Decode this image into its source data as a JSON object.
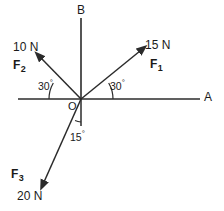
{
  "diagram": {
    "type": "free-body-vector-diagram",
    "origin_label": "O",
    "stroke_color": "#2b2b2b",
    "text_color": "#1a1a1a",
    "background": "#ffffff",
    "axes": [
      {
        "name": "horizontal-axis",
        "label": "A",
        "direction": "right",
        "has_arrowhead": false
      },
      {
        "name": "vertical-axis",
        "label": "B",
        "direction": "up",
        "has_arrowhead": false
      }
    ],
    "vectors": [
      {
        "name": "F1",
        "label": "F",
        "subscript": "1",
        "magnitude": "15 N",
        "magnitude_value": 15,
        "unit": "N",
        "angle_from_positive_x_deg": 30,
        "angle_label": "30",
        "angle_reference": "positive x-axis (OA)",
        "quadrant": "upper-right"
      },
      {
        "name": "F2",
        "label": "F",
        "subscript": "2",
        "magnitude": "10 N",
        "magnitude_value": 10,
        "unit": "N",
        "angle_from_positive_x_deg": 150,
        "angle_label": "30",
        "angle_reference": "negative x-axis",
        "quadrant": "upper-left"
      },
      {
        "name": "F3",
        "label": "F",
        "subscript": "3",
        "magnitude": "20 N",
        "magnitude_value": 20,
        "unit": "N",
        "angle_from_positive_x_deg": 255,
        "angle_label": "15",
        "angle_reference": "downward vertical",
        "quadrant": "lower-left"
      }
    ],
    "angle_arcs": [
      {
        "name": "angle-arc-right",
        "value": "30",
        "unit": "degrees"
      },
      {
        "name": "angle-arc-left",
        "value": "30",
        "unit": "degrees"
      },
      {
        "name": "angle-arc-bottom",
        "value": "15",
        "unit": "degrees"
      }
    ],
    "degree_symbol": "°"
  }
}
